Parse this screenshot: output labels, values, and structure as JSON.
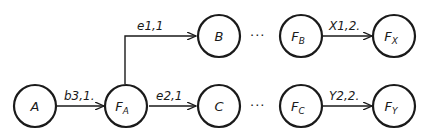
{
  "diagram": {
    "nodes": [
      {
        "id": "A",
        "label": "A",
        "sub": ""
      },
      {
        "id": "FA",
        "label": "F",
        "sub": "A"
      },
      {
        "id": "B",
        "label": "B",
        "sub": ""
      },
      {
        "id": "C",
        "label": "C",
        "sub": ""
      },
      {
        "id": "FB",
        "label": "F",
        "sub": "B"
      },
      {
        "id": "FC",
        "label": "F",
        "sub": "C"
      },
      {
        "id": "FX",
        "label": "F",
        "sub": "X"
      },
      {
        "id": "FY",
        "label": "F",
        "sub": "Y"
      }
    ],
    "edges": [
      {
        "from": "A",
        "to": "FA",
        "label": "b3,1."
      },
      {
        "from": "FA",
        "to": "B",
        "label": "e1,1"
      },
      {
        "from": "FA",
        "to": "C",
        "label": "e2,1"
      },
      {
        "from": "FB",
        "to": "FX",
        "label": "X1,2."
      },
      {
        "from": "FC",
        "to": "FY",
        "label": "Y2,2."
      }
    ],
    "ellipsis": "···"
  }
}
